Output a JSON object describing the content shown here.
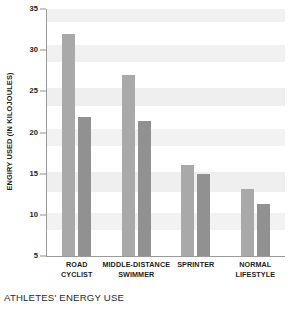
{
  "caption": "ATHLETES' ENERGY USE",
  "chart_data": {
    "type": "bar",
    "title": "ATHLETES' ENERGY USE",
    "xlabel": "",
    "ylabel": "ENGIRY USED (IN KILOJOULES)",
    "ylim": [
      5,
      35
    ],
    "yticks": [
      35,
      30,
      25,
      20,
      15,
      10,
      5
    ],
    "ytick_labels": [
      "35",
      "30",
      "25",
      "20",
      "15",
      "10",
      "5"
    ],
    "grid": false,
    "background_bands": true,
    "legend": "none",
    "categories": [
      "ROAD\nCYCLIST",
      "MIDDLE-DISTANCE\nSWIMMER",
      "SPRINTER",
      "NORMAL\nLIFESTYLE"
    ],
    "category_lines": [
      [
        "ROAD",
        "CYCLIST"
      ],
      [
        "MIDDLE-DISTANCE",
        "SWIMMER"
      ],
      [
        "SPRINTER",
        ""
      ],
      [
        "NORMAL",
        "LIFESTYLE"
      ]
    ],
    "series": [
      {
        "name": "series-1",
        "color": "#a9a9a9",
        "values": [
          32.0,
          27.0,
          16.0,
          13.2
        ]
      },
      {
        "name": "series-2",
        "color": "#919191",
        "values": [
          21.9,
          21.4,
          15.0,
          11.3
        ]
      }
    ]
  },
  "colors": {
    "bar_light": "#a9a9a9",
    "bar_dark": "#919191",
    "band": "#efefef",
    "plot_background": "#ffffff",
    "axis": "#9a9a9a",
    "text": "#1d1d1d"
  },
  "bands": [
    {
      "from": 35,
      "to": 33.4,
      "shade": "#f1f1f1"
    },
    {
      "from": 30.6,
      "to": 28.6,
      "shade": "#f1f1f1"
    },
    {
      "from": 25.4,
      "to": 23.2,
      "shade": "#efefef"
    },
    {
      "from": 20.4,
      "to": 18.4,
      "shade": "#f2f2f2"
    },
    {
      "from": 15.2,
      "to": 12.8,
      "shade": "#efefef"
    },
    {
      "from": 10.2,
      "to": 8.2,
      "shade": "#f2f2f2"
    }
  ]
}
